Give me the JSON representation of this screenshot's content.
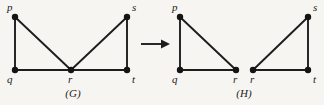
{
  "figure": {
    "background_color": "#f6f5f1",
    "ink_color": "#1d1d1d",
    "caption_left": "(G)",
    "caption_right": "(H)",
    "transform_arrow": "right-arrow"
  },
  "graph_g": {
    "caption": "(G)",
    "vertices": [
      {
        "id": "p",
        "label": "p",
        "x": 15,
        "y": 17,
        "label_x": 7,
        "label_y": 11
      },
      {
        "id": "q",
        "label": "q",
        "x": 15,
        "y": 70,
        "label_x": 7,
        "label_y": 83
      },
      {
        "id": "r",
        "label": "r",
        "x": 71,
        "y": 70,
        "label_x": 68,
        "label_y": 83
      },
      {
        "id": "s",
        "label": "s",
        "x": 127,
        "y": 17,
        "label_x": 132,
        "label_y": 11
      },
      {
        "id": "t",
        "label": "t",
        "x": 127,
        "y": 70,
        "label_x": 132,
        "label_y": 83
      }
    ],
    "edges": [
      {
        "from": "p",
        "to": "q"
      },
      {
        "from": "p",
        "to": "r"
      },
      {
        "from": "q",
        "to": "r"
      },
      {
        "from": "r",
        "to": "s"
      },
      {
        "from": "r",
        "to": "t"
      },
      {
        "from": "s",
        "to": "t"
      }
    ],
    "caption_x": 73,
    "caption_y": 97
  },
  "graph_h": {
    "caption": "(H)",
    "vertices": [
      {
        "id": "p",
        "label": "p",
        "x": 180,
        "y": 17,
        "label_x": 172,
        "label_y": 11
      },
      {
        "id": "q",
        "label": "q",
        "x": 180,
        "y": 70,
        "label_x": 172,
        "label_y": 83
      },
      {
        "id": "r1",
        "label": "r",
        "x": 236,
        "y": 70,
        "label_x": 233,
        "label_y": 83
      },
      {
        "id": "r2",
        "label": "r",
        "x": 253,
        "y": 70,
        "label_x": 250,
        "label_y": 83
      },
      {
        "id": "s",
        "label": "s",
        "x": 308,
        "y": 17,
        "label_x": 313,
        "label_y": 11
      },
      {
        "id": "t",
        "label": "t",
        "x": 308,
        "y": 70,
        "label_x": 313,
        "label_y": 83
      }
    ],
    "edges": [
      {
        "from": "p",
        "to": "q"
      },
      {
        "from": "p",
        "to": "r1"
      },
      {
        "from": "q",
        "to": "r1"
      },
      {
        "from": "r2",
        "to": "s"
      },
      {
        "from": "r2",
        "to": "t"
      },
      {
        "from": "s",
        "to": "t"
      }
    ],
    "caption_x": 244,
    "caption_y": 97
  },
  "arrow": {
    "x1": 141,
    "x2": 163,
    "y": 44,
    "tip_x": 170
  }
}
